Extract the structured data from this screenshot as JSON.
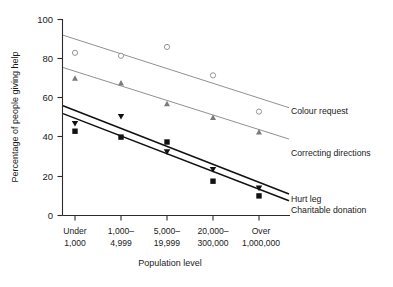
{
  "chart_data": {
    "type": "scatter",
    "title": "",
    "xlabel": "Population level",
    "ylabel": "Percentage of people giving help",
    "categories": [
      "Under\n1,000",
      "1,000–\n4,999",
      "5,000–\n19,999",
      "20,000–\n300,000",
      "Over\n1,000,000"
    ],
    "category_lines": [
      [
        "Under",
        "1,000"
      ],
      [
        "1,000–",
        "4,999"
      ],
      [
        "5,000–",
        "19,999"
      ],
      [
        "20,000–",
        "300,000"
      ],
      [
        "Over",
        "1,000,000"
      ]
    ],
    "ylim": [
      0,
      100
    ],
    "yticks": [
      0,
      20,
      40,
      60,
      80,
      100
    ],
    "ytick_labels": [
      "0",
      "20",
      "40",
      "60",
      "80",
      "100"
    ],
    "grid": false,
    "legend_position": "right-inline",
    "series": [
      {
        "name": "Colour request",
        "marker": "open-circle",
        "color": "#8a8a8a",
        "values": [
          83,
          81.5,
          86,
          71.5,
          53
        ],
        "trend_start": 92,
        "trend_end": 55
      },
      {
        "name": "Correcting directions",
        "marker": "filled-triangle-up",
        "color": "#7b7b7b",
        "values": [
          70,
          67.5,
          57,
          50,
          42.5
        ],
        "trend_start": 75.5,
        "trend_end": 39
      },
      {
        "name": "Hurt leg",
        "marker": "filled-triangle-down",
        "color": "#111111",
        "values": [
          47,
          50.5,
          32.5,
          23.5,
          14
        ],
        "trend_start": 56,
        "trend_end": 11
      },
      {
        "name": "Charitable donation",
        "marker": "filled-square",
        "color": "#111111",
        "values": [
          43,
          40,
          37.5,
          17.5,
          10
        ],
        "trend_start": 52,
        "trend_end": 7.5
      }
    ]
  },
  "axes": {
    "y_axis_title": "Percentage of people giving help",
    "x_axis_title": "Population level"
  },
  "series_labels": {
    "colour_request": "Colour request",
    "correcting_directions": "Correcting directions",
    "hurt_leg": "Hurt leg",
    "charitable_donation": "Charitable donation"
  },
  "ytick_labels": {
    "t0": "0",
    "t20": "20",
    "t40": "40",
    "t60": "60",
    "t80": "80",
    "t100": "100"
  },
  "xtick_labels": {
    "c1a": "Under",
    "c1b": "1,000",
    "c2a": "1,000–",
    "c2b": "4,999",
    "c3a": "5,000–",
    "c3b": "19,999",
    "c4a": "20,000–",
    "c4b": "300,000",
    "c5a": "Over",
    "c5b": "1,000,000"
  },
  "colors": {
    "light_series": "#8a8a8a",
    "mid_series": "#7b7b7b",
    "dark_series": "#111111",
    "axis": "#2b2b2b",
    "background": "#ffffff"
  }
}
